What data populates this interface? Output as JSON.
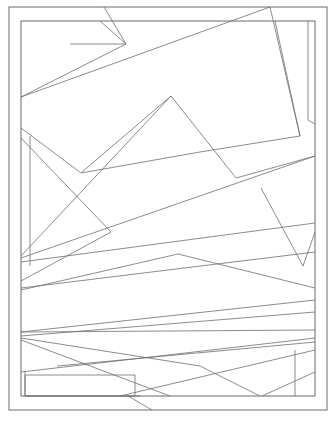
{
  "canvas": {
    "width": 336,
    "height": 424,
    "background": "#ffffff",
    "title": "Abstract geometric line composition"
  },
  "style": {
    "stroke_color": "#6f6f6f",
    "stroke_width": 0.8,
    "outer_stroke_color": "#6a6a6a",
    "outer_stroke_width": 1,
    "fill": "none"
  },
  "artwork": {
    "name": "abstract-polygon-line-art",
    "description": "White page with thin grey straight lines partitioning a framed rectangle into irregular polygons",
    "frames": [
      {
        "name": "outer-frame",
        "x": 9,
        "y": 7,
        "width": 318,
        "height": 403
      },
      {
        "name": "inner-frame",
        "x": 21,
        "y": 21,
        "width": 294,
        "height": 375
      }
    ],
    "lines": [
      {
        "name": "line-top-left-short-diagonal",
        "x1": 100,
        "y1": 21,
        "x2": 126,
        "y2": 44
      },
      {
        "name": "line-top-long-diagonal-left",
        "x1": 126,
        "y1": 44,
        "x2": 21,
        "y2": 97
      },
      {
        "name": "line-top-major-diagonal",
        "x1": 21,
        "y1": 97,
        "x2": 270,
        "y2": 7
      },
      {
        "name": "line-upper-right-edge-run",
        "x1": 270,
        "y1": 7,
        "x2": 300,
        "y2": 136
      },
      {
        "name": "line-right-inner-vertical",
        "x1": 275,
        "y1": 21,
        "x2": 300,
        "y2": 136
      },
      {
        "name": "line-mid-right-band-top",
        "x1": 300,
        "y1": 136,
        "x2": 200,
        "y2": 152
      },
      {
        "name": "line-mid-band-upper",
        "x1": 200,
        "y1": 152,
        "x2": 81,
        "y2": 173
      },
      {
        "name": "line-mid-band-left-drop",
        "x1": 81,
        "y1": 173,
        "x2": 21,
        "y2": 128
      },
      {
        "name": "line-center-wedge-upper",
        "x1": 171,
        "y1": 96,
        "x2": 82,
        "y2": 172
      },
      {
        "name": "line-center-wedge-long",
        "x1": 171,
        "y1": 96,
        "x2": 21,
        "y2": 256
      },
      {
        "name": "line-center-wedge-right",
        "x1": 171,
        "y1": 96,
        "x2": 236,
        "y2": 178
      },
      {
        "name": "line-right-fan-a",
        "x1": 236,
        "y1": 178,
        "x2": 315,
        "y2": 156
      },
      {
        "name": "line-right-long-sweep",
        "x1": 315,
        "y1": 156,
        "x2": 21,
        "y2": 258
      },
      {
        "name": "line-right-vertical-panel",
        "x1": 261,
        "y1": 188,
        "x2": 303,
        "y2": 266
      },
      {
        "name": "line-right-panel-join",
        "x1": 303,
        "y1": 266,
        "x2": 315,
        "y2": 232
      },
      {
        "name": "line-upper-left-short",
        "x1": 70,
        "y1": 44,
        "x2": 126,
        "y2": 44
      },
      {
        "name": "line-diag-upper-left-corner",
        "x1": 104,
        "y1": 7,
        "x2": 126,
        "y2": 44
      },
      {
        "name": "line-mid-left-triangle-top",
        "x1": 21,
        "y1": 138,
        "x2": 111,
        "y2": 232
      },
      {
        "name": "line-mid-left-triangle-bottom",
        "x1": 111,
        "y1": 232,
        "x2": 21,
        "y2": 281
      },
      {
        "name": "line-left-inner-vertical-short",
        "x1": 30,
        "y1": 136,
        "x2": 30,
        "y2": 266
      },
      {
        "name": "line-mid-sweep-long-a",
        "x1": 21,
        "y1": 262,
        "x2": 315,
        "y2": 223
      },
      {
        "name": "line-mid-sweep-long-b",
        "x1": 21,
        "y1": 288,
        "x2": 315,
        "y2": 252
      },
      {
        "name": "line-center-peak-left",
        "x1": 21,
        "y1": 290,
        "x2": 178,
        "y2": 254
      },
      {
        "name": "line-center-peak-right",
        "x1": 178,
        "y1": 254,
        "x2": 315,
        "y2": 288
      },
      {
        "name": "line-fan-left-hub-a",
        "x1": 21,
        "y1": 332,
        "x2": 315,
        "y2": 300
      },
      {
        "name": "line-fan-left-hub-flat",
        "x1": 21,
        "y1": 332,
        "x2": 315,
        "y2": 330
      },
      {
        "name": "line-fan-left-hub-b",
        "x1": 21,
        "y1": 336,
        "x2": 315,
        "y2": 312
      },
      {
        "name": "line-fan-left-hub-c",
        "x1": 21,
        "y1": 338,
        "x2": 200,
        "y2": 366
      },
      {
        "name": "line-fan-left-hub-d",
        "x1": 21,
        "y1": 340,
        "x2": 170,
        "y2": 396
      },
      {
        "name": "line-fan-down-right",
        "x1": 57,
        "y1": 366,
        "x2": 315,
        "y2": 342
      },
      {
        "name": "line-lower-long-diagonal",
        "x1": 21,
        "y1": 372,
        "x2": 315,
        "y2": 338
      },
      {
        "name": "line-lower-wedge-a",
        "x1": 120,
        "y1": 396,
        "x2": 315,
        "y2": 350
      },
      {
        "name": "line-lower-wedge-b",
        "x1": 200,
        "y1": 366,
        "x2": 260,
        "y2": 396
      },
      {
        "name": "line-lower-wedge-c",
        "x1": 128,
        "y1": 396,
        "x2": 152,
        "y2": 410
      },
      {
        "name": "line-bottom-right-vertical",
        "x1": 295,
        "y1": 350,
        "x2": 295,
        "y2": 396
      },
      {
        "name": "line-bottom-right-corner-diag",
        "x1": 262,
        "y1": 396,
        "x2": 315,
        "y2": 372
      },
      {
        "name": "line-upper-right-small-vertical",
        "x1": 308,
        "y1": 21,
        "x2": 308,
        "y2": 120
      },
      {
        "name": "line-right-upper-notch",
        "x1": 308,
        "y1": 120,
        "x2": 315,
        "y2": 124
      }
    ],
    "rects": [
      {
        "name": "rect-bottom-left-panel",
        "x": 25,
        "y": 375,
        "width": 110,
        "height": 21
      }
    ],
    "polylines": [
      {
        "name": "polyline-bottom-left-step",
        "points": "25,371 25,396 140,396"
      }
    ]
  }
}
